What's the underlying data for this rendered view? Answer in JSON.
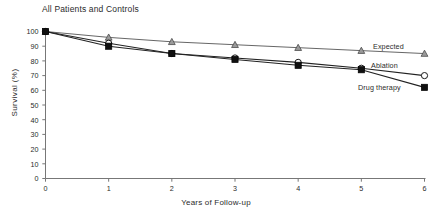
{
  "chart_data": {
    "type": "line",
    "title": "All Patients and Controls",
    "xlabel": "Years of Follow-up",
    "ylabel": "Survival (%)",
    "x": [
      0,
      1,
      2,
      3,
      4,
      5,
      6
    ],
    "xlim": [
      0,
      6
    ],
    "ylim": [
      0,
      100
    ],
    "xticks": [
      "0",
      "1",
      "2",
      "3",
      "4",
      "5",
      "6"
    ],
    "yticks": [
      "0",
      "10",
      "20",
      "30",
      "40",
      "50",
      "60",
      "70",
      "80",
      "90",
      "100"
    ],
    "grid": false,
    "legend_position": "inline-right",
    "series": [
      {
        "name": "Expected",
        "marker": "triangle-up",
        "marker_fill": "#9a9a9a",
        "color": "#555555",
        "values": [
          100,
          96,
          93,
          91,
          89,
          87,
          85
        ]
      },
      {
        "name": "Ablation",
        "marker": "circle-open",
        "marker_fill": "#ffffff",
        "color": "#222222",
        "values": [
          100,
          92,
          85,
          82,
          79,
          75,
          70
        ]
      },
      {
        "name": "Drug therapy",
        "marker": "square-filled",
        "marker_fill": "#101010",
        "color": "#222222",
        "values": [
          100,
          90,
          85,
          81,
          77,
          74,
          62
        ]
      }
    ]
  },
  "colors": {
    "axis": "#777777",
    "text": "#2b2b2b",
    "background": "#ffffff"
  }
}
